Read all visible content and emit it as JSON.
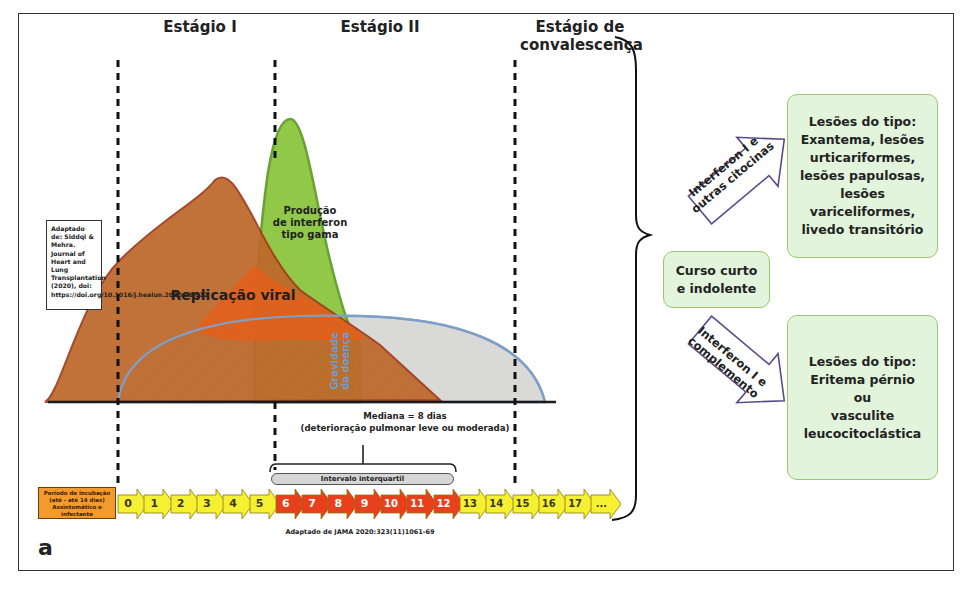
{
  "figure": {
    "panel_label": "a",
    "stages": [
      {
        "label": "Estágio I"
      },
      {
        "label": "Estágio II"
      },
      {
        "label": "Estágio de\nconvalescença"
      }
    ],
    "reference_box": "Adaptado de: Siddqi & Mehra. Journal of Heart and Lung Transplantation (2020), doi: https://doi.org/10.1016/j.healun.2020.03.012",
    "curves": [
      {
        "name": "viral-replication",
        "label": "Replicação viral",
        "fill": "#b5652f",
        "stroke": "#a23a1a"
      },
      {
        "name": "interferon-gamma",
        "label": "Produção\nde interferon\ntipo gama",
        "fill": "#8cc63f",
        "stroke": "#5f9e2a"
      },
      {
        "name": "disease-severity",
        "label": "Gravidade\nda doença",
        "fill": "#d9d9d9",
        "stroke": "#7f9fc8"
      }
    ],
    "median_note": "Mediana = 8 dias\n(deterioração pulmonar leve ou moderada)",
    "iqr_label": "Intervalo interquartil",
    "incubation_box": "Período de incubação\n(até - até 14 dias)\nAssintomático e\ninfectante",
    "timeline_days": [
      {
        "label": "0",
        "color": "yellow"
      },
      {
        "label": "1",
        "color": "yellow"
      },
      {
        "label": "2",
        "color": "yellow"
      },
      {
        "label": "3",
        "color": "yellow"
      },
      {
        "label": "4",
        "color": "yellow"
      },
      {
        "label": "5",
        "color": "yellow"
      },
      {
        "label": "6",
        "color": "red"
      },
      {
        "label": "7",
        "color": "red"
      },
      {
        "label": "8",
        "color": "red"
      },
      {
        "label": "9",
        "color": "red"
      },
      {
        "label": "10",
        "color": "red"
      },
      {
        "label": "11",
        "color": "red"
      },
      {
        "label": "12",
        "color": "red"
      },
      {
        "label": "13",
        "color": "yellow"
      },
      {
        "label": "14",
        "color": "yellow"
      },
      {
        "label": "15",
        "color": "yellow"
      },
      {
        "label": "16",
        "color": "yellow"
      },
      {
        "label": "17",
        "color": "yellow"
      },
      {
        "label": "...",
        "color": "yellow"
      }
    ],
    "timeline_source": "Adaptado de JAMA 2020:323(11)1061-69"
  },
  "outcomes": {
    "center_box": "Curso curto\ne indolente",
    "arrow_up_label": "Interferon I e\noutras citocinas",
    "arrow_down_label": "Interferon I e\ncomplemento",
    "top_box": "Lesões do tipo:\nExantema, lesões\nurticariformes,\nlesões papulosas,\nlesões\nvariceliformes,\nlivedo transitório",
    "bottom_box": "Lesões do tipo:\nEritema pérnio\nou\nvasculite\nleucocitoclástica"
  },
  "colors": {
    "yellow_arrow": "#f5f032",
    "red_arrow": "#e8401c",
    "incubation": "#f39a2c",
    "green_box_bg": "#e3f4dc",
    "green_box_border": "#9cc76e",
    "purple_arrow": "#5a4a8a"
  }
}
